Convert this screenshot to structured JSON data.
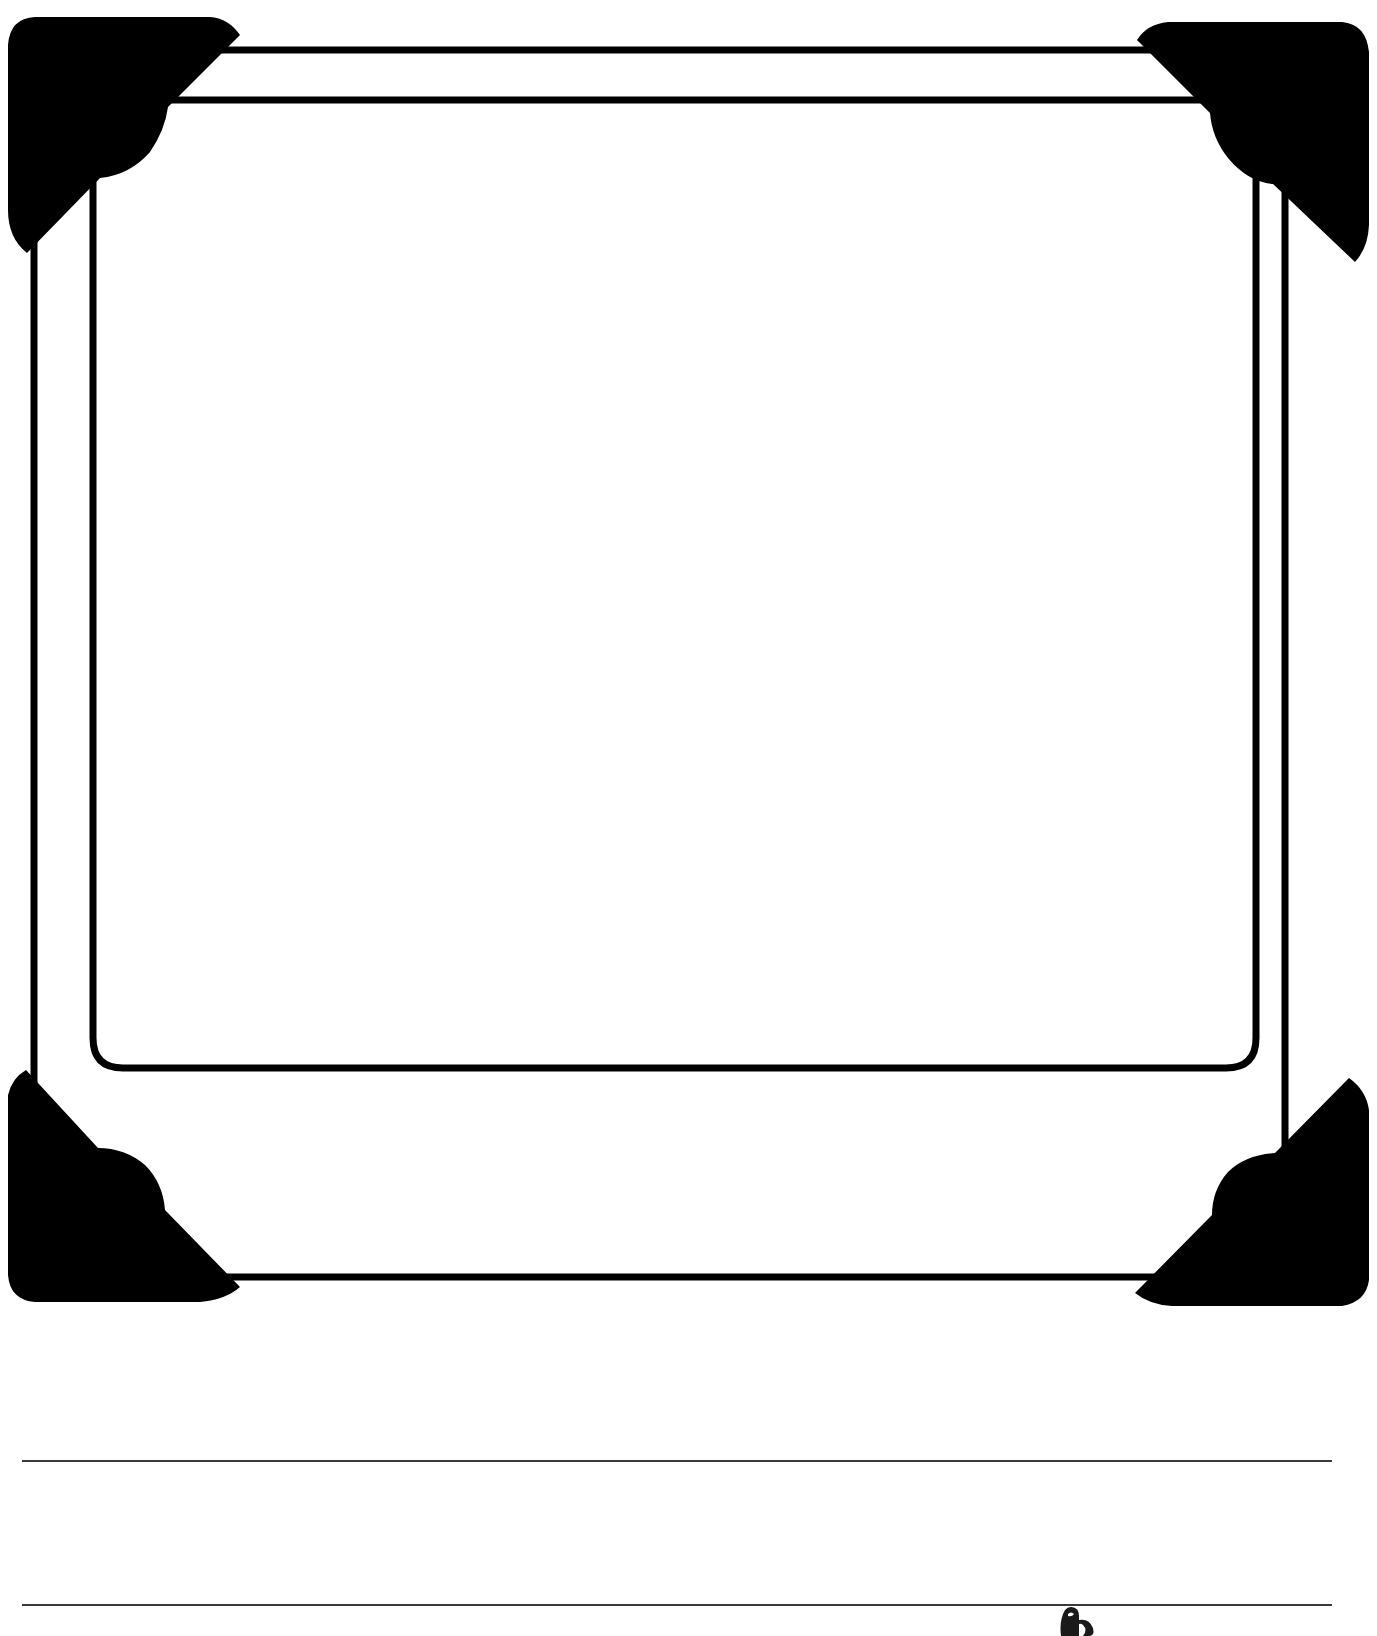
{
  "page": {
    "type": "photo-frame-worksheet",
    "background_color": "#ffffff",
    "ink_color": "#000000"
  },
  "frame": {
    "outer_border": {
      "left": 34,
      "top": 50,
      "right": 1285,
      "bottom": 1277
    },
    "inner_border": {
      "left": 93,
      "top": 100,
      "right": 1256,
      "bottom": 1068,
      "bottom_corner_radius": 30
    },
    "corner_mounts": [
      {
        "position": "top-left",
        "icon": "photo-corner-icon"
      },
      {
        "position": "top-right",
        "icon": "photo-corner-icon"
      },
      {
        "position": "bottom-left",
        "icon": "photo-corner-icon"
      },
      {
        "position": "bottom-right",
        "icon": "photo-corner-icon"
      }
    ],
    "photo_area_text": ""
  },
  "writing_lines": [
    {
      "y": 1460,
      "x_start": 22,
      "x_end": 1332,
      "text": ""
    },
    {
      "y": 1604,
      "x_start": 22,
      "x_end": 1332,
      "text": ""
    }
  ],
  "decorations": {
    "bottom_icon": "cup-icon"
  }
}
